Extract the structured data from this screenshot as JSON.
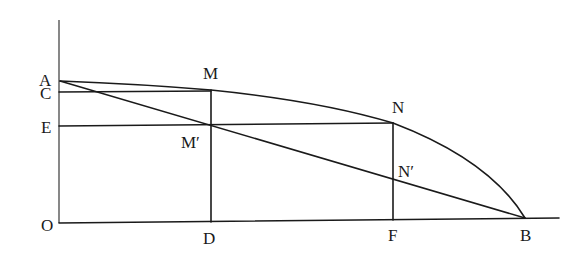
{
  "diagram": {
    "title": "",
    "points": {
      "O": {
        "label": "O"
      },
      "A": {
        "label": "A"
      },
      "C": {
        "label": "C"
      },
      "E": {
        "label": "E"
      },
      "M": {
        "label": "M"
      },
      "M_prime": {
        "label": "M′"
      },
      "N": {
        "label": "N"
      },
      "N_prime": {
        "label": "N′"
      },
      "D": {
        "label": "D"
      },
      "F": {
        "label": "F"
      },
      "B": {
        "label": "B"
      }
    },
    "elements": [
      "vertical axis through O and A",
      "horizontal axis O to B",
      "curve A-M-N-B",
      "straight line A-M'-N'-B",
      "horizontal C-M",
      "horizontal E-M'-N",
      "vertical M-M'-D",
      "vertical N-N'-F"
    ],
    "colors": {
      "stroke": "#1a1a1a",
      "background": "#ffffff"
    }
  }
}
